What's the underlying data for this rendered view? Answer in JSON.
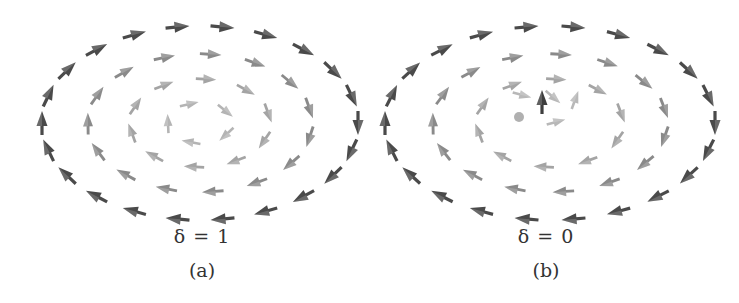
{
  "figure": {
    "panels": [
      {
        "id": "a",
        "label": "(a)",
        "parameter": "δ = 1",
        "center": [
          200,
          123
        ],
        "rings": [
          {
            "rx": 158,
            "ry": 97,
            "count": 22,
            "shade": "#4a4a4a",
            "size": 1.0
          },
          {
            "rx": 112,
            "ry": 69,
            "count": 15,
            "shade": "#8a8a8a",
            "size": 0.9
          },
          {
            "rx": 70,
            "ry": 44,
            "count": 10,
            "shade": "#a4a4a4",
            "size": 0.85
          },
          {
            "rx": 32,
            "ry": 20,
            "count": 5,
            "shade": "#b4b4b4",
            "size": 0.8
          }
        ],
        "center_features": []
      },
      {
        "id": "b",
        "label": "(b)",
        "parameter": "δ = 0",
        "center": [
          550,
          123
        ],
        "rings": [
          {
            "rx": 165,
            "ry": 97,
            "count": 22,
            "shade": "#4a4a4a",
            "size": 1.0
          },
          {
            "rx": 117,
            "ry": 69,
            "count": 15,
            "shade": "#8a8a8a",
            "size": 0.9
          },
          {
            "rx": 73,
            "ry": 44,
            "count": 10,
            "shade": "#a4a4a4",
            "size": 0.85
          }
        ],
        "center_features": [
          {
            "type": "dot",
            "x": 519,
            "y": 117,
            "r": 5,
            "shade": "#b0b0b0"
          },
          {
            "type": "arrow",
            "x": 542,
            "y": 102,
            "angle": -90,
            "shade": "#3e3e3e",
            "size": 1.0
          },
          {
            "type": "arrow",
            "x": 553,
            "y": 97,
            "angle": 40,
            "shade": "#b8b8b8",
            "size": 0.8
          },
          {
            "type": "arrow",
            "x": 575,
            "y": 100,
            "angle": -70,
            "shade": "#b8b8b8",
            "size": 0.8
          },
          {
            "type": "arrow",
            "x": 556,
            "y": 122,
            "angle": -15,
            "shade": "#b8b8b8",
            "size": 0.8
          },
          {
            "type": "arrow",
            "x": 522,
            "y": 95,
            "angle": 15,
            "shade": "#b8b8b8",
            "size": 0.8
          }
        ]
      }
    ],
    "circulation": "counterclockwise",
    "captions": {
      "a": {
        "parameter": "δ = 1",
        "label": "(a)"
      },
      "b": {
        "parameter": "δ = 0",
        "label": "(b)"
      }
    }
  }
}
